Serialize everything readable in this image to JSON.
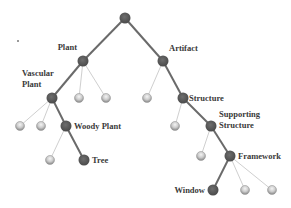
{
  "diagram": {
    "type": "taxonomy-tree",
    "colors": {
      "path_node": "#5c5c5c",
      "path_edge": "#6a6a6a",
      "leaf_node": "#c8c8c8",
      "leaf_edge": "#cfcfcf",
      "label": "#3a3a3a"
    },
    "nodes": [
      {
        "id": "root",
        "label": "",
        "parent": null,
        "kind": "path"
      },
      {
        "id": "plant",
        "label": "Plant",
        "parent": "root",
        "kind": "path"
      },
      {
        "id": "artifact",
        "label": "Artifact",
        "parent": "root",
        "kind": "path"
      },
      {
        "id": "vascular",
        "label_lines": [
          "Vascular",
          "Plant"
        ],
        "parent": "plant",
        "kind": "path"
      },
      {
        "id": "plant_leaf1",
        "label": "",
        "parent": "plant",
        "kind": "leaf"
      },
      {
        "id": "plant_leaf2",
        "label": "",
        "parent": "plant",
        "kind": "leaf"
      },
      {
        "id": "artifact_leaf1",
        "label": "",
        "parent": "artifact",
        "kind": "leaf"
      },
      {
        "id": "structure",
        "label": "Structure",
        "parent": "artifact",
        "kind": "path"
      },
      {
        "id": "vascular_leaf1",
        "label": "",
        "parent": "vascular",
        "kind": "leaf"
      },
      {
        "id": "vascular_leaf2",
        "label": "",
        "parent": "vascular",
        "kind": "leaf"
      },
      {
        "id": "woody",
        "label": "Woody Plant",
        "parent": "vascular",
        "kind": "path"
      },
      {
        "id": "structure_leaf1",
        "label": "",
        "parent": "structure",
        "kind": "leaf"
      },
      {
        "id": "supporting",
        "label_lines": [
          "Supporting",
          "Structure"
        ],
        "parent": "structure",
        "kind": "path"
      },
      {
        "id": "woody_leaf1",
        "label": "",
        "parent": "woody",
        "kind": "leaf"
      },
      {
        "id": "tree",
        "label": "Tree",
        "parent": "woody",
        "kind": "path"
      },
      {
        "id": "supporting_leaf1",
        "label": "",
        "parent": "supporting",
        "kind": "leaf"
      },
      {
        "id": "framework",
        "label": "Framework",
        "parent": "supporting",
        "kind": "path"
      },
      {
        "id": "window",
        "label": "Window",
        "parent": "framework",
        "kind": "path"
      },
      {
        "id": "framework_leaf1",
        "label": "",
        "parent": "framework",
        "kind": "leaf"
      },
      {
        "id": "framework_leaf2",
        "label": "",
        "parent": "framework",
        "kind": "leaf"
      }
    ]
  }
}
